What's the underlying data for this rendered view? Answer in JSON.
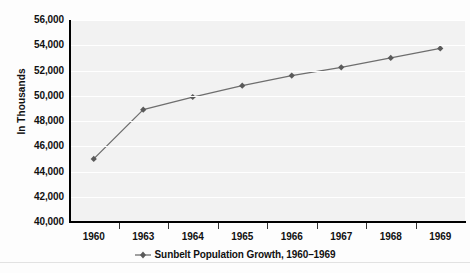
{
  "chart_data": {
    "type": "line",
    "title": "",
    "xlabel": "",
    "ylabel": "In Thousands",
    "categories": [
      "1960",
      "1963",
      "1964",
      "1965",
      "1966",
      "1967",
      "1968",
      "1969"
    ],
    "series": [
      {
        "name": "Sunbelt Population Growth, 1960–1969",
        "values": [
          45000,
          48900,
          49900,
          50800,
          51600,
          52250,
          53000,
          53750
        ]
      }
    ],
    "ylim": [
      40000,
      56000
    ],
    "y_ticks": [
      "40,000",
      "42,000",
      "44,000",
      "46,000",
      "48,000",
      "50,000",
      "52,000",
      "54,000",
      "56,000"
    ],
    "y_tick_values": [
      40000,
      42000,
      44000,
      46000,
      48000,
      50000,
      52000,
      54000,
      56000
    ],
    "grid": true,
    "legend_position": "bottom",
    "line_color": "#6e6e6e",
    "marker_color": "#5a5a5a",
    "plot_background": "#f2f2f2",
    "gridline_color": "#ffffff"
  },
  "legend": {
    "entries": [
      {
        "label": "Sunbelt Population Growth, 1960–1969",
        "marker": "line-diamond-marker"
      }
    ]
  }
}
